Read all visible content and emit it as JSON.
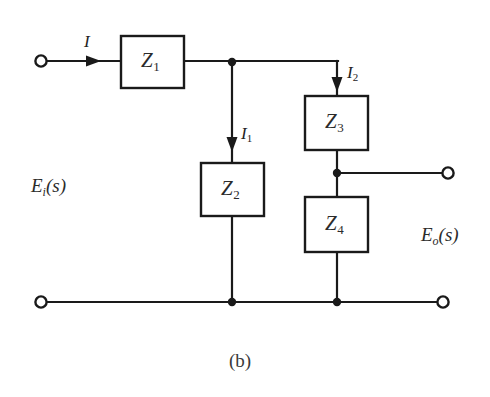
{
  "figure": {
    "caption": "(b)",
    "background_color": "#ffffff",
    "line_color": "#1a1a1a",
    "width": 490,
    "height": 397
  },
  "blocks": [
    {
      "id": "z1",
      "symbol": "Z",
      "subscript": "1",
      "x": 121,
      "y": 36,
      "w": 63,
      "h": 52
    },
    {
      "id": "z2",
      "symbol": "Z",
      "subscript": "2",
      "x": 201,
      "y": 163,
      "w": 63,
      "h": 53
    },
    {
      "id": "z3",
      "symbol": "Z",
      "subscript": "3",
      "x": 305,
      "y": 96,
      "w": 63,
      "h": 54
    },
    {
      "id": "z4",
      "symbol": "Z",
      "subscript": "4",
      "x": 305,
      "y": 197,
      "w": 63,
      "h": 55
    }
  ],
  "currents": [
    {
      "id": "i",
      "symbol": "I",
      "subscript": "",
      "label_x": 84,
      "label_y": 35
    },
    {
      "id": "i1",
      "symbol": "I",
      "subscript": "1",
      "label_x": 242,
      "label_y": 127
    },
    {
      "id": "i2",
      "symbol": "I",
      "subscript": "2",
      "label_x": 347,
      "label_y": 66
    }
  ],
  "ports": [
    {
      "id": "input",
      "symbol": "E",
      "subscript": "i",
      "suffix": "(s)",
      "label_x": 30,
      "label_y": 176
    },
    {
      "id": "output",
      "symbol": "E",
      "subscript": "o",
      "suffix": "(s)",
      "label_x": 420,
      "label_y": 226
    }
  ],
  "terminals": [
    {
      "id": "input-top",
      "cx": 41,
      "cy": 61,
      "r": 6
    },
    {
      "id": "input-bottom",
      "cx": 41,
      "cy": 302,
      "r": 6
    },
    {
      "id": "output-top",
      "cx": 448,
      "cy": 173,
      "r": 6
    },
    {
      "id": "output-bottom",
      "cx": 443,
      "cy": 302,
      "r": 6
    }
  ],
  "junctions": [
    {
      "id": "node-a",
      "cx": 232,
      "cy": 62,
      "r": 4
    },
    {
      "id": "node-b",
      "cx": 337,
      "cy": 173,
      "r": 4
    },
    {
      "id": "node-c",
      "cx": 232,
      "cy": 302,
      "r": 4
    },
    {
      "id": "node-d",
      "cx": 337,
      "cy": 302,
      "r": 4
    }
  ]
}
